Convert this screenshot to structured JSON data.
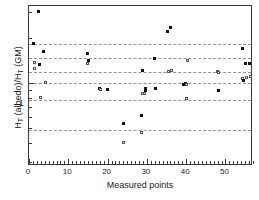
{
  "chart_data": {
    "type": "scatter",
    "title": "",
    "xlabel": "Measured points",
    "ylabel": "Hᴛ (albedo)/Hᴛ (GM)",
    "ylabel_parts": {
      "h1": "H",
      "sub1": "T",
      "mid": " (albedo)/H",
      "sub2": "T",
      "end": " (GM)"
    },
    "yscale": "log",
    "xscale": "linear",
    "xlim": [
      0,
      57
    ],
    "ylim": [
      0.28,
      3.3
    ],
    "grid": true,
    "grid_style": "dash-dot horizontal",
    "legend": "none",
    "xticks": [
      0,
      10,
      20,
      30,
      40,
      50
    ],
    "xtick_labels": [
      "0",
      "10",
      "20",
      "30",
      "40",
      "50"
    ],
    "yticks": [
      1
    ],
    "ytick_labels": [
      "1"
    ],
    "gridline_values": [
      1.85,
      1.48,
      1.2,
      1.0,
      0.78,
      0.49
    ],
    "points": [
      {
        "x": 2.3,
        "y": 3.02,
        "marker": "filled"
      },
      {
        "x": 1.2,
        "y": 1.86,
        "marker": "filled"
      },
      {
        "x": 3.6,
        "y": 1.63,
        "marker": "filled"
      },
      {
        "x": 1.5,
        "y": 1.39,
        "marker": "open"
      },
      {
        "x": 2.7,
        "y": 1.33,
        "marker": "filled"
      },
      {
        "x": 1.4,
        "y": 1.26,
        "marker": "open"
      },
      {
        "x": 4.1,
        "y": 1.01,
        "marker": "open"
      },
      {
        "x": 3.0,
        "y": 0.8,
        "marker": "open"
      },
      {
        "x": 15.0,
        "y": 1.58,
        "marker": "filled"
      },
      {
        "x": 15.1,
        "y": 1.42,
        "marker": "filled"
      },
      {
        "x": 15.0,
        "y": 1.36,
        "marker": "open"
      },
      {
        "x": 18.0,
        "y": 0.92,
        "marker": "filled"
      },
      {
        "x": 18.2,
        "y": 0.91,
        "marker": "open"
      },
      {
        "x": 20.0,
        "y": 0.91,
        "marker": "filled"
      },
      {
        "x": 24.0,
        "y": 0.54,
        "marker": "filled"
      },
      {
        "x": 24.1,
        "y": 0.4,
        "marker": "open"
      },
      {
        "x": 28.5,
        "y": 0.61,
        "marker": "filled"
      },
      {
        "x": 28.6,
        "y": 0.47,
        "marker": "open"
      },
      {
        "x": 28.8,
        "y": 1.22,
        "marker": "filled"
      },
      {
        "x": 29.6,
        "y": 0.93,
        "marker": "filled"
      },
      {
        "x": 29.7,
        "y": 0.89,
        "marker": "filled"
      },
      {
        "x": 29.5,
        "y": 0.86,
        "marker": "open"
      },
      {
        "x": 29.0,
        "y": 0.85,
        "marker": "open"
      },
      {
        "x": 32.0,
        "y": 1.48,
        "marker": "filled"
      },
      {
        "x": 32.2,
        "y": 0.92,
        "marker": "filled"
      },
      {
        "x": 35.2,
        "y": 2.24,
        "marker": "filled"
      },
      {
        "x": 36.0,
        "y": 2.38,
        "marker": "filled"
      },
      {
        "x": 35.5,
        "y": 1.2,
        "marker": "open"
      },
      {
        "x": 36.3,
        "y": 1.23,
        "marker": "open"
      },
      {
        "x": 39.2,
        "y": 0.99,
        "marker": "filled"
      },
      {
        "x": 39.7,
        "y": 1.0,
        "marker": "filled"
      },
      {
        "x": 40.0,
        "y": 0.99,
        "marker": "open"
      },
      {
        "x": 40.3,
        "y": 1.42,
        "marker": "open"
      },
      {
        "x": 40.2,
        "y": 0.79,
        "marker": "open"
      },
      {
        "x": 48.0,
        "y": 1.21,
        "marker": "open"
      },
      {
        "x": 48.2,
        "y": 1.19,
        "marker": "open"
      },
      {
        "x": 48.1,
        "y": 0.9,
        "marker": "filled"
      },
      {
        "x": 54.3,
        "y": 1.72,
        "marker": "filled"
      },
      {
        "x": 55.2,
        "y": 1.36,
        "marker": "filled"
      },
      {
        "x": 56.1,
        "y": 1.36,
        "marker": "filled"
      },
      {
        "x": 54.4,
        "y": 1.08,
        "marker": "open"
      },
      {
        "x": 55.3,
        "y": 1.1,
        "marker": "open"
      },
      {
        "x": 54.5,
        "y": 1.05,
        "marker": "filled"
      },
      {
        "x": 56.3,
        "y": 1.12,
        "marker": "open"
      }
    ]
  }
}
